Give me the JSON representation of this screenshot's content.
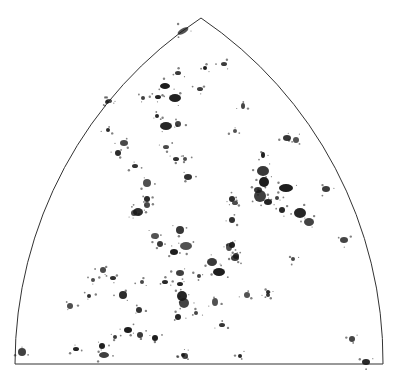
{
  "figure": {
    "caption_fragment": "· · · ·  · ·  ·  ·  ·",
    "shape": "spherical-triangle (gothic arch)",
    "outline_color": "#333333",
    "fill_color": "#ffffff",
    "blob_color": "#1a1a1a",
    "vertices": {
      "apex": [
        201,
        18
      ],
      "bottom_left": [
        15,
        364
      ],
      "bottom_right": [
        383,
        364
      ]
    },
    "arc_radius": 415,
    "blobs": [
      [
        183,
        31,
        6,
        2.5,
        -30
      ],
      [
        107,
        102,
        2,
        2,
        0
      ],
      [
        165,
        86,
        5,
        3,
        0
      ],
      [
        178,
        73,
        3,
        2,
        0
      ],
      [
        205,
        68,
        2,
        2,
        0
      ],
      [
        224,
        64,
        3,
        2,
        0
      ],
      [
        175,
        98,
        6,
        4,
        0
      ],
      [
        200,
        89,
        3,
        2,
        0
      ],
      [
        158,
        97,
        3,
        2,
        0
      ],
      [
        143,
        98,
        2,
        2,
        0
      ],
      [
        166,
        126,
        6,
        4,
        0
      ],
      [
        178,
        124,
        3,
        3,
        0
      ],
      [
        157,
        116,
        2,
        2,
        0
      ],
      [
        243,
        106,
        2,
        3,
        0
      ],
      [
        108,
        130,
        2,
        2,
        0
      ],
      [
        124,
        143,
        4,
        3,
        0
      ],
      [
        118,
        153,
        3,
        3,
        0
      ],
      [
        166,
        147,
        3,
        2,
        0
      ],
      [
        176,
        159,
        3,
        2,
        0
      ],
      [
        185,
        159,
        2,
        2,
        0
      ],
      [
        188,
        177,
        4,
        3,
        0
      ],
      [
        147,
        183,
        4,
        4,
        0
      ],
      [
        135,
        166,
        3,
        2,
        0
      ],
      [
        235,
        131,
        2,
        2,
        0
      ],
      [
        287,
        138,
        4,
        3,
        0
      ],
      [
        296,
        140,
        3,
        3,
        0
      ],
      [
        263,
        171,
        6,
        5,
        0
      ],
      [
        264,
        182,
        5,
        5,
        0
      ],
      [
        258,
        190,
        4,
        3,
        0
      ],
      [
        286,
        188,
        7,
        4,
        0
      ],
      [
        326,
        189,
        4,
        3,
        0
      ],
      [
        263,
        155,
        2,
        3,
        0
      ],
      [
        260,
        196,
        6,
        6,
        0
      ],
      [
        268,
        202,
        4,
        3,
        0
      ],
      [
        277,
        198,
        2,
        2,
        0
      ],
      [
        300,
        213,
        6,
        5,
        0
      ],
      [
        309,
        222,
        5,
        4,
        0
      ],
      [
        282,
        210,
        3,
        3,
        0
      ],
      [
        344,
        240,
        4,
        3,
        0
      ],
      [
        147,
        199,
        3,
        3,
        0
      ],
      [
        147,
        205,
        3,
        3,
        0
      ],
      [
        138,
        212,
        5,
        4,
        0
      ],
      [
        134,
        213,
        3,
        3,
        0
      ],
      [
        232,
        199,
        3,
        3,
        0
      ],
      [
        235,
        203,
        3,
        2,
        0
      ],
      [
        232,
        220,
        3,
        3,
        0
      ],
      [
        229,
        247,
        3,
        4,
        0
      ],
      [
        236,
        256,
        3,
        3,
        0
      ],
      [
        186,
        246,
        6,
        4,
        0
      ],
      [
        180,
        230,
        4,
        4,
        0
      ],
      [
        155,
        236,
        4,
        3,
        0
      ],
      [
        160,
        244,
        3,
        3,
        0
      ],
      [
        174,
        252,
        4,
        3,
        0
      ],
      [
        212,
        262,
        5,
        4,
        0
      ],
      [
        219,
        272,
        6,
        4,
        0
      ],
      [
        235,
        258,
        4,
        3,
        0
      ],
      [
        232,
        245,
        3,
        3,
        0
      ],
      [
        180,
        273,
        4,
        3,
        0
      ],
      [
        180,
        284,
        3,
        2,
        0
      ],
      [
        199,
        276,
        2,
        2,
        0
      ],
      [
        182,
        296,
        5,
        5,
        0
      ],
      [
        184,
        303,
        5,
        5,
        0
      ],
      [
        178,
        317,
        3,
        3,
        0
      ],
      [
        196,
        313,
        2,
        2,
        0
      ],
      [
        165,
        282,
        3,
        2,
        0
      ],
      [
        142,
        282,
        2,
        2,
        0
      ],
      [
        123,
        295,
        4,
        4,
        0
      ],
      [
        103,
        270,
        3,
        3,
        0
      ],
      [
        113,
        278,
        3,
        2,
        0
      ],
      [
        93,
        280,
        2,
        2,
        0
      ],
      [
        89,
        296,
        2,
        2,
        0
      ],
      [
        70,
        306,
        3,
        3,
        0
      ],
      [
        139,
        310,
        3,
        3,
        0
      ],
      [
        215,
        302,
        3,
        4,
        0
      ],
      [
        222,
        325,
        3,
        2,
        0
      ],
      [
        247,
        295,
        3,
        3,
        0
      ],
      [
        268,
        295,
        2,
        2,
        0
      ],
      [
        128,
        330,
        4,
        3,
        0
      ],
      [
        140,
        335,
        3,
        3,
        0
      ],
      [
        155,
        338,
        3,
        3,
        0
      ],
      [
        115,
        337,
        2,
        2,
        0
      ],
      [
        102,
        346,
        3,
        3,
        0
      ],
      [
        104,
        355,
        5,
        3,
        0
      ],
      [
        76,
        349,
        3,
        2,
        0
      ],
      [
        22,
        352,
        4,
        4,
        0
      ],
      [
        183,
        355,
        2,
        2,
        0
      ],
      [
        185,
        356,
        3,
        3,
        0
      ],
      [
        240,
        356,
        2,
        2,
        0
      ],
      [
        352,
        339,
        3,
        3,
        0
      ],
      [
        366,
        362,
        4,
        3,
        0
      ],
      [
        293,
        259,
        2,
        2,
        0
      ],
      [
        268,
        292,
        2,
        2,
        0
      ],
      [
        109,
        101,
        3,
        2,
        0
      ]
    ]
  }
}
